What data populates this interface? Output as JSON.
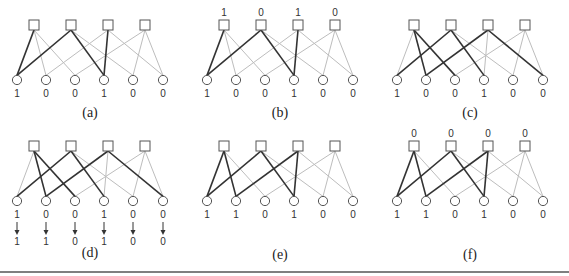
{
  "figure": {
    "panels": [
      {
        "id": "a",
        "caption": "(a)",
        "origin": [
          0,
          0
        ],
        "check_labels": [],
        "variable_labels": [
          "1",
          "0",
          "0",
          "1",
          "0",
          "0"
        ],
        "updated_labels": [],
        "edges": [
          {
            "check": 0,
            "var": 0,
            "dark": true
          },
          {
            "check": 0,
            "var": 1,
            "dark": false
          },
          {
            "check": 0,
            "var": 2,
            "dark": false
          },
          {
            "check": 1,
            "var": 0,
            "dark": true
          },
          {
            "check": 1,
            "var": 3,
            "dark": true
          },
          {
            "check": 1,
            "var": 4,
            "dark": false
          },
          {
            "check": 2,
            "var": 1,
            "dark": false
          },
          {
            "check": 2,
            "var": 3,
            "dark": true
          },
          {
            "check": 2,
            "var": 5,
            "dark": false
          },
          {
            "check": 3,
            "var": 2,
            "dark": false
          },
          {
            "check": 3,
            "var": 4,
            "dark": false
          },
          {
            "check": 3,
            "var": 5,
            "dark": false
          }
        ]
      },
      {
        "id": "b",
        "caption": "(b)",
        "origin": [
          190,
          0
        ],
        "check_labels": [
          "1",
          "0",
          "1",
          "0"
        ],
        "variable_labels": [
          "1",
          "0",
          "0",
          "1",
          "0",
          "0"
        ],
        "updated_labels": [],
        "edges": [
          {
            "check": 0,
            "var": 0,
            "dark": true
          },
          {
            "check": 0,
            "var": 1,
            "dark": false
          },
          {
            "check": 0,
            "var": 2,
            "dark": false
          },
          {
            "check": 1,
            "var": 0,
            "dark": true
          },
          {
            "check": 1,
            "var": 3,
            "dark": true
          },
          {
            "check": 1,
            "var": 4,
            "dark": false
          },
          {
            "check": 2,
            "var": 1,
            "dark": false
          },
          {
            "check": 2,
            "var": 3,
            "dark": true
          },
          {
            "check": 2,
            "var": 5,
            "dark": false
          },
          {
            "check": 3,
            "var": 2,
            "dark": false
          },
          {
            "check": 3,
            "var": 4,
            "dark": false
          },
          {
            "check": 3,
            "var": 5,
            "dark": false
          }
        ]
      },
      {
        "id": "c",
        "caption": "(c)",
        "origin": [
          380,
          0
        ],
        "check_labels": [],
        "variable_labels": [
          "1",
          "0",
          "0",
          "1",
          "0",
          "0"
        ],
        "updated_labels": [],
        "edges": [
          {
            "check": 0,
            "var": 0,
            "dark": false
          },
          {
            "check": 0,
            "var": 1,
            "dark": true
          },
          {
            "check": 0,
            "var": 2,
            "dark": true
          },
          {
            "check": 1,
            "var": 0,
            "dark": true
          },
          {
            "check": 1,
            "var": 3,
            "dark": true
          },
          {
            "check": 1,
            "var": 4,
            "dark": false
          },
          {
            "check": 2,
            "var": 1,
            "dark": true
          },
          {
            "check": 2,
            "var": 3,
            "dark": false
          },
          {
            "check": 2,
            "var": 5,
            "dark": true
          },
          {
            "check": 3,
            "var": 2,
            "dark": false
          },
          {
            "check": 3,
            "var": 4,
            "dark": false
          },
          {
            "check": 3,
            "var": 5,
            "dark": false
          }
        ]
      },
      {
        "id": "d",
        "caption": "(d)",
        "origin": [
          0,
          121
        ],
        "check_labels": [],
        "variable_labels": [
          "1",
          "0",
          "0",
          "1",
          "0",
          "0"
        ],
        "updated_labels": [
          "1",
          "1",
          "0",
          "1",
          "0",
          "0"
        ],
        "edges": [
          {
            "check": 0,
            "var": 0,
            "dark": false
          },
          {
            "check": 0,
            "var": 1,
            "dark": true
          },
          {
            "check": 0,
            "var": 2,
            "dark": true
          },
          {
            "check": 1,
            "var": 0,
            "dark": true
          },
          {
            "check": 1,
            "var": 3,
            "dark": true
          },
          {
            "check": 1,
            "var": 4,
            "dark": false
          },
          {
            "check": 2,
            "var": 1,
            "dark": true
          },
          {
            "check": 2,
            "var": 3,
            "dark": false
          },
          {
            "check": 2,
            "var": 5,
            "dark": true
          },
          {
            "check": 3,
            "var": 2,
            "dark": false
          },
          {
            "check": 3,
            "var": 4,
            "dark": false
          },
          {
            "check": 3,
            "var": 5,
            "dark": false
          }
        ]
      },
      {
        "id": "e",
        "caption": "(e)",
        "origin": [
          190,
          121
        ],
        "check_labels": [],
        "variable_labels": [
          "1",
          "1",
          "0",
          "1",
          "0",
          "0"
        ],
        "updated_labels": [],
        "edges": [
          {
            "check": 0,
            "var": 0,
            "dark": true
          },
          {
            "check": 0,
            "var": 1,
            "dark": true
          },
          {
            "check": 0,
            "var": 2,
            "dark": false
          },
          {
            "check": 1,
            "var": 0,
            "dark": true
          },
          {
            "check": 1,
            "var": 3,
            "dark": true
          },
          {
            "check": 1,
            "var": 4,
            "dark": false
          },
          {
            "check": 2,
            "var": 1,
            "dark": true
          },
          {
            "check": 2,
            "var": 3,
            "dark": true
          },
          {
            "check": 2,
            "var": 5,
            "dark": false
          },
          {
            "check": 3,
            "var": 2,
            "dark": false
          },
          {
            "check": 3,
            "var": 4,
            "dark": false
          },
          {
            "check": 3,
            "var": 5,
            "dark": false
          }
        ]
      },
      {
        "id": "f",
        "caption": "(f)",
        "origin": [
          380,
          121
        ],
        "check_labels": [
          "0",
          "0",
          "0",
          "0"
        ],
        "variable_labels": [
          "1",
          "1",
          "0",
          "1",
          "0",
          "0"
        ],
        "updated_labels": [],
        "edges": [
          {
            "check": 0,
            "var": 0,
            "dark": true
          },
          {
            "check": 0,
            "var": 1,
            "dark": true
          },
          {
            "check": 0,
            "var": 2,
            "dark": false
          },
          {
            "check": 1,
            "var": 0,
            "dark": true
          },
          {
            "check": 1,
            "var": 3,
            "dark": true
          },
          {
            "check": 1,
            "var": 4,
            "dark": false
          },
          {
            "check": 2,
            "var": 1,
            "dark": true
          },
          {
            "check": 2,
            "var": 3,
            "dark": true
          },
          {
            "check": 2,
            "var": 5,
            "dark": false
          },
          {
            "check": 3,
            "var": 2,
            "dark": false
          },
          {
            "check": 3,
            "var": 4,
            "dark": false
          },
          {
            "check": 3,
            "var": 5,
            "dark": false
          }
        ]
      }
    ],
    "colors": {
      "dark_edge": "#333333",
      "light_edge": "#bdbdbd",
      "node_stroke": "#555555",
      "text": "#333333"
    }
  }
}
